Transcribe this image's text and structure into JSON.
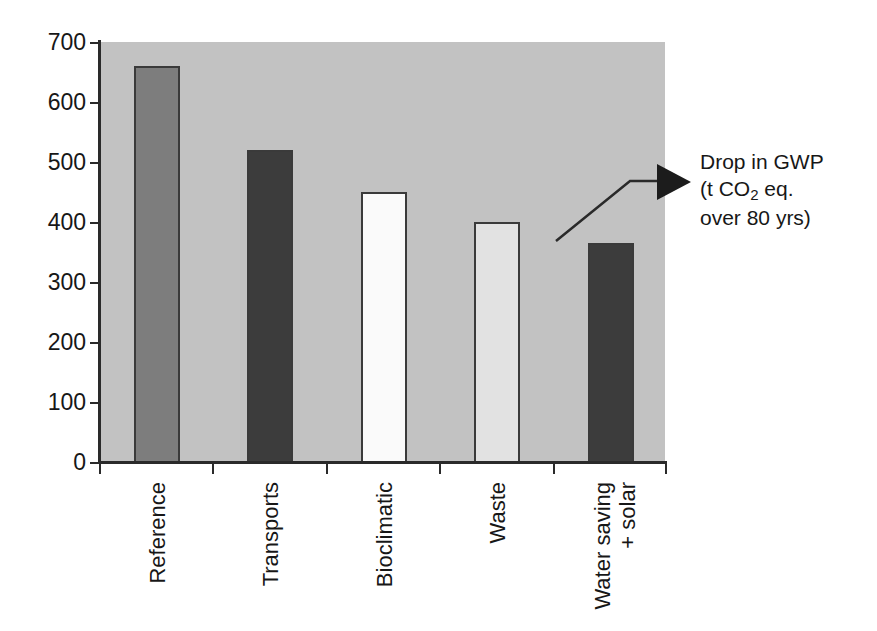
{
  "chart_data": {
    "type": "bar",
    "title": "",
    "subtitle": "",
    "xlabel": "",
    "ylabel": "",
    "ylim": [
      0,
      700
    ],
    "ytick_step": 100,
    "yticks": [
      "700",
      "600",
      "500",
      "400",
      "300",
      "200",
      "100",
      "0"
    ],
    "grid": false,
    "legend": "none",
    "categories": [
      "Reference",
      "Transports",
      "Bioclimatic",
      "Waste",
      "Water saving + solar"
    ],
    "category_lines": [
      [
        "Reference"
      ],
      [
        "Transports"
      ],
      [
        "Bioclimatic"
      ],
      [
        "Waste"
      ],
      [
        "Water saving",
        "+ solar"
      ]
    ],
    "values": [
      660,
      520,
      450,
      400,
      365
    ],
    "bar_colors": [
      "#7d7d7d",
      "#3c3c3c",
      "#fafafa",
      "#e2e2e2",
      "#3c3c3c"
    ],
    "bar_border_color": "#3a3a3a",
    "plot_background": "#c2c2c2",
    "figure_background": "#ffffff",
    "axis_color": "#2a2a2a",
    "annotation": {
      "line1": "Drop in GWP",
      "line2_pre": "(t CO",
      "line2_sub": "2",
      "line2_post": " eq.",
      "line3": "over 80 yrs)",
      "arrow": "right-triangle",
      "arrow_color": "#1c1c1c"
    }
  }
}
